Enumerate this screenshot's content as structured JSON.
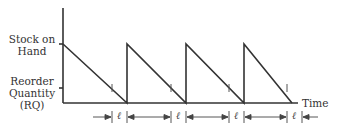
{
  "diagram": {
    "type": "inventory sawtooth",
    "y_label_top": [
      "Stock on",
      "Hand"
    ],
    "y_label_reorder": [
      "Reorder",
      "Quantity",
      "(RQ)"
    ],
    "x_label": "Time",
    "lead_time_symbol": "ℓ",
    "cycles": 4,
    "colors": {
      "line": "#333333",
      "background": "#ffffff"
    }
  }
}
